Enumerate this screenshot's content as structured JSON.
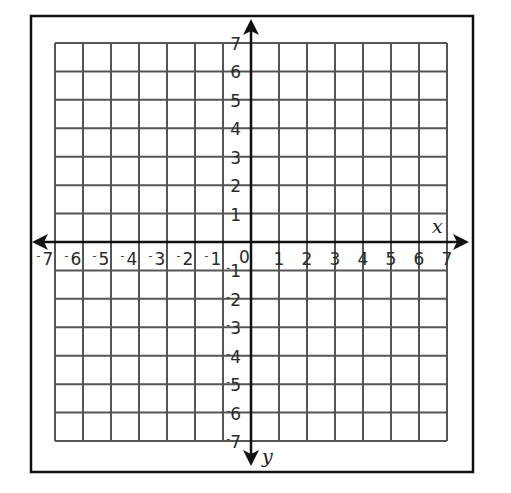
{
  "diagram": {
    "type": "coordinate-plane",
    "x_axis": {
      "label": "x",
      "min": -7,
      "max": 7,
      "step": 1
    },
    "y_axis": {
      "label": "y",
      "min": -7,
      "max": 7,
      "step": 1,
      "orientation": "positive-up, label at bottom arrow"
    },
    "origin_label": "0",
    "x_tick_labels": [
      "-7",
      "-6",
      "-5",
      "-4",
      "-3",
      "-2",
      "-1",
      "1",
      "2",
      "3",
      "4",
      "5",
      "6",
      "7"
    ],
    "y_tick_labels": [
      "7",
      "6",
      "5",
      "4",
      "3",
      "2",
      "1",
      "-1",
      "-2",
      "-3",
      "-4",
      "-5",
      "-6",
      "-7"
    ],
    "grid": {
      "columns": 14,
      "rows": 14,
      "color": "#555555"
    },
    "axis_color": "#111111",
    "frame_color": "#111111"
  }
}
